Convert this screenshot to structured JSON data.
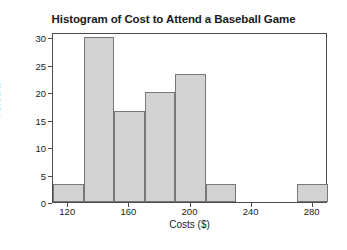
{
  "chart_data": {
    "type": "bar",
    "title": "Histogram of Cost to Attend a Baseball Game",
    "xlabel": "Costs ($)",
    "ylabel": "Percent",
    "grid": false,
    "legend": null,
    "xlim": [
      110,
      290
    ],
    "ylim": [
      0,
      31
    ],
    "bin_width": 20,
    "xticks": [
      120,
      160,
      200,
      240,
      280
    ],
    "xtick_labels": [
      "120",
      "160",
      "200",
      "240",
      "280"
    ],
    "yticks": [
      0,
      5,
      10,
      15,
      20,
      25,
      30
    ],
    "ytick_labels": [
      "0",
      "5",
      "10",
      "15",
      "20",
      "25",
      "30"
    ],
    "bins": [
      {
        "left": 110,
        "right": 130,
        "label": "110-130",
        "value": 3.33
      },
      {
        "left": 130,
        "right": 150,
        "label": "130-150",
        "value": 30.0
      },
      {
        "left": 150,
        "right": 170,
        "label": "150-170",
        "value": 16.67
      },
      {
        "left": 170,
        "right": 190,
        "label": "170-190",
        "value": 20.0
      },
      {
        "left": 190,
        "right": 210,
        "label": "190-210",
        "value": 23.33
      },
      {
        "left": 210,
        "right": 230,
        "label": "210-230",
        "value": 3.33
      },
      {
        "left": 230,
        "right": 250,
        "label": "230-250",
        "value": 0
      },
      {
        "left": 250,
        "right": 270,
        "label": "250-270",
        "value": 0
      },
      {
        "left": 270,
        "right": 290,
        "label": "270-290",
        "value": 3.33
      }
    ],
    "categories": [
      "110-130",
      "130-150",
      "150-170",
      "170-190",
      "190-210",
      "210-230",
      "230-250",
      "250-270",
      "270-290"
    ],
    "values": [
      3.33,
      30.0,
      16.67,
      20.0,
      23.33,
      3.33,
      0,
      0,
      3.33
    ],
    "colors": {
      "bar_fill": "#d2d2d2",
      "bar_edge": "#777777",
      "axis": "#4a4a4a",
      "text": "#1a1a1a",
      "background": "#ffffff"
    }
  }
}
